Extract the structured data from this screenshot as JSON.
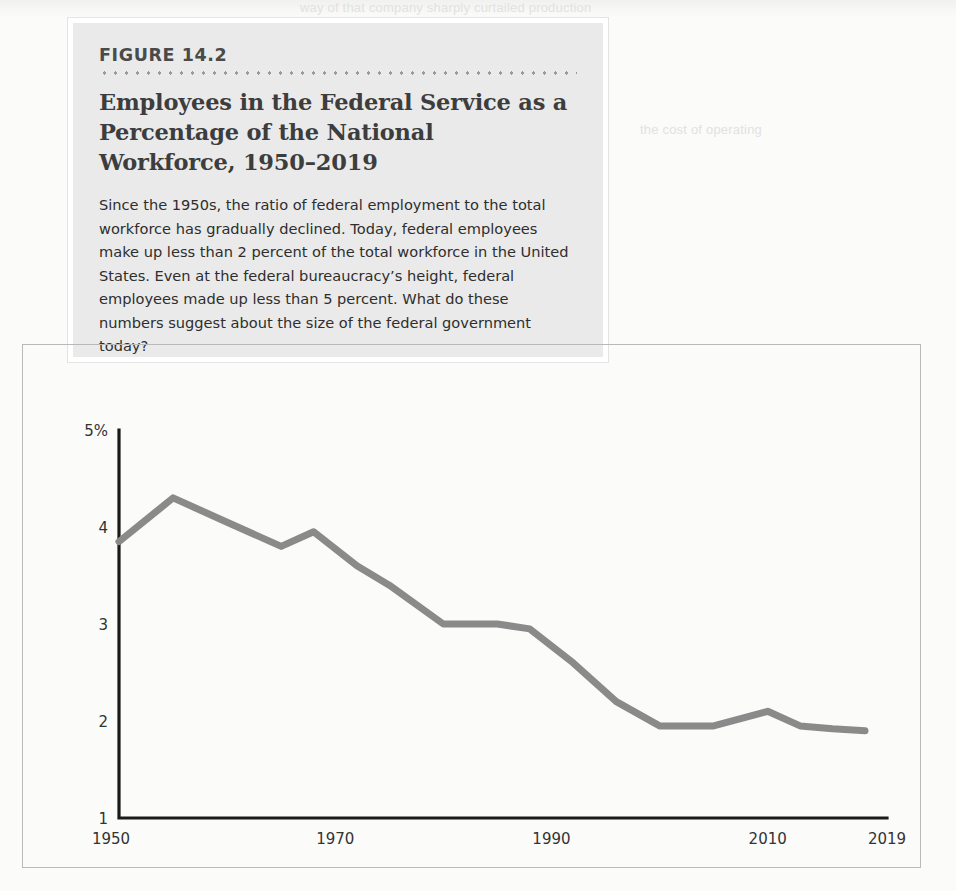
{
  "figure": {
    "number": "FIGURE 14.2",
    "title": "Employees in the Federal Service as a Percentage of the National Workforce, 1950–2019",
    "description": "Since the 1950s, the ratio of federal employment to the total workforce has gradually declined. Today, federal employees make up less than 2 percent of the total workforce in the United States. Even at the federal bureaucracy’s height, federal employees made up less than 5 percent. What do these numbers suggest about the size of the federal government today?"
  },
  "colors": {
    "line": "#8a8a8a",
    "axis": "#1a1a1a",
    "panel_bg": "#eaeaea",
    "frame": "#b9b9b7",
    "text": "#2e2e2e"
  },
  "chart_data": {
    "type": "line",
    "title": "Employees in the Federal Service as a Percentage of the National Workforce, 1950–2019",
    "xlabel": "",
    "ylabel": "",
    "xlim": [
      1950,
      2019
    ],
    "ylim": [
      1,
      5
    ],
    "grid": false,
    "legend": false,
    "y_tick_labels": [
      "5%",
      "4",
      "3",
      "2",
      "1"
    ],
    "y_ticks": [
      5,
      4,
      3,
      2,
      1
    ],
    "x_tick_labels": [
      "1950",
      "1970",
      "1990",
      "2010",
      "2019"
    ],
    "x_ticks": [
      1950,
      1970,
      1990,
      2010,
      2019
    ],
    "series": [
      {
        "name": "Federal employees as % of national workforce",
        "x": [
          1950,
          1955,
          1960,
          1965,
          1968,
          1972,
          1975,
          1980,
          1985,
          1988,
          1992,
          1996,
          2000,
          2005,
          2010,
          2013,
          2016,
          2019
        ],
        "values": [
          3.85,
          4.3,
          4.05,
          3.8,
          3.95,
          3.6,
          3.4,
          3.0,
          3.0,
          2.95,
          2.6,
          2.2,
          1.95,
          1.95,
          2.1,
          1.95,
          1.92,
          1.9
        ]
      }
    ]
  },
  "ghost": {
    "line1": "way of that company sharply curtailed production",
    "line2": "the cost of operating",
    "line3": "most closely aligned with federal bureaucracy"
  }
}
